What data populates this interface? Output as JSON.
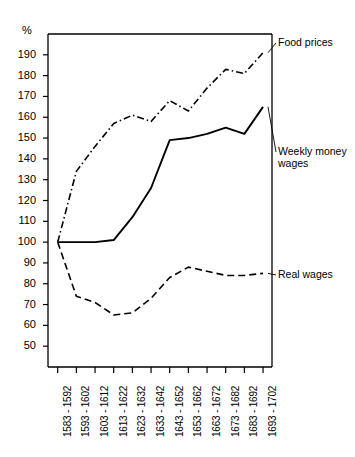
{
  "chart_data": {
    "type": "line",
    "title": "",
    "subtitle": "",
    "xlabel": "",
    "ylabel": "%",
    "ylim": [
      40,
      200
    ],
    "ytick_step": 10,
    "grid": false,
    "legend_position": "right-inline-annotations",
    "yticks": [
      190,
      180,
      170,
      160,
      150,
      140,
      130,
      120,
      110,
      100,
      90,
      80,
      70,
      60,
      50
    ],
    "ytick_labels": [
      "190",
      "180",
      "170",
      "160",
      "150",
      "140",
      "130",
      "120",
      "110",
      "100",
      "90",
      "80",
      "70",
      "60",
      "50"
    ],
    "categories": [
      "1583 - 1592",
      "1593 - 1602",
      "1603 - 1612",
      "1613 - 1622",
      "1623 - 1632",
      "1633 - 1642",
      "1643 - 1652",
      "1653 - 1662",
      "1663 - 1672",
      "1673 - 1682",
      "1683 - 1692",
      "1693 - 1702"
    ],
    "series": [
      {
        "name": "Food prices",
        "style": "dash-dot",
        "color": "#000000",
        "values": [
          100,
          134,
          146,
          157,
          161,
          158,
          168,
          163,
          174,
          183,
          181,
          191
        ]
      },
      {
        "name": "Weekly money wages",
        "style": "solid",
        "color": "#000000",
        "values": [
          100,
          100,
          100,
          101,
          112,
          126,
          149,
          150,
          152,
          155,
          152,
          165
        ]
      },
      {
        "name": "Real wages",
        "style": "dashed",
        "color": "#000000",
        "values": [
          100,
          74,
          71,
          65,
          66,
          73,
          83,
          88,
          86,
          84,
          84,
          85
        ]
      }
    ],
    "annotations": [
      {
        "text": "Food prices",
        "series": "Food prices"
      },
      {
        "text": "Weekly money\nwages",
        "series": "Weekly money wages"
      },
      {
        "text": "Real wages",
        "series": "Real wages"
      }
    ]
  }
}
